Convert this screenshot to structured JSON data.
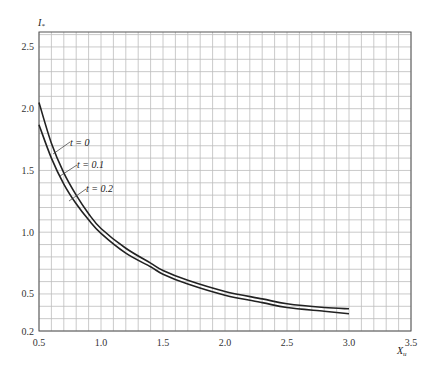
{
  "chart_data": {
    "type": "line",
    "title": "",
    "xlabel": "X_u",
    "ylabel": "I_*",
    "xlim": [
      0.5,
      3.5
    ],
    "ylim": [
      0.2,
      2.62
    ],
    "grid": true,
    "grid_step": 0.1,
    "x_ticks": [
      "0.5",
      "1.0",
      "1.5",
      "2.0",
      "2.5",
      "3.0",
      "3.5"
    ],
    "y_ticks": [
      "0.2",
      "0.5",
      "1.0",
      "1.5",
      "2.0",
      "2.5"
    ],
    "legend": "inline annotations",
    "series": [
      {
        "name": "t = 0",
        "x": [
          0.5,
          0.6,
          0.7,
          0.8,
          0.9,
          1.0,
          1.2,
          1.4,
          1.5,
          1.7,
          2.0,
          2.3,
          2.5,
          2.8,
          3.0
        ],
        "values": [
          2.05,
          1.72,
          1.48,
          1.3,
          1.15,
          1.03,
          0.87,
          0.75,
          0.69,
          0.61,
          0.52,
          0.46,
          0.42,
          0.39,
          0.38
        ]
      },
      {
        "name": "t = 0.1",
        "x": [
          0.5,
          0.6,
          0.7,
          0.8,
          0.9,
          1.0,
          1.2,
          1.4,
          1.5,
          1.7,
          2.0,
          2.3,
          2.5,
          2.8,
          3.0
        ],
        "values": [
          1.87,
          1.6,
          1.39,
          1.23,
          1.1,
          0.99,
          0.83,
          0.72,
          0.66,
          0.58,
          0.49,
          0.43,
          0.39,
          0.36,
          0.34
        ]
      },
      {
        "name": "t = 0.2",
        "x": [
          0.5,
          0.6,
          0.7,
          0.8,
          0.9,
          1.0,
          1.2,
          1.4,
          1.5,
          1.7,
          2.0,
          2.3,
          2.5,
          2.8,
          3.0
        ],
        "values": [
          1.87,
          1.6,
          1.39,
          1.23,
          1.1,
          0.99,
          0.83,
          0.72,
          0.66,
          0.58,
          0.49,
          0.43,
          0.39,
          0.36,
          0.34
        ]
      }
    ],
    "annotations": [
      {
        "text": "t = 0",
        "target": "upper curve"
      },
      {
        "text": "t = 0.1",
        "target": "between curves"
      },
      {
        "text": "t = 0.2",
        "target": "lower curve"
      }
    ]
  },
  "labels": {
    "y_axis": "I",
    "y_axis_sub": "*",
    "x_axis": "X",
    "x_axis_sub": "u",
    "ann_t0": "t = 0",
    "ann_t01": "t = 0.1",
    "ann_t02": "t = 0.2"
  }
}
